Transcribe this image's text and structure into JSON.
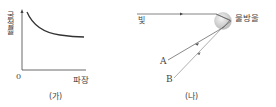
{
  "panel_a": {
    "caption": "(가)",
    "y_axis_label": "굴절률",
    "x_axis_label": "파장",
    "origin_label": "0",
    "curve": "refractive index decreases with wavelength (decaying curve)"
  },
  "panel_b": {
    "caption": "(나)",
    "light_label": "빛",
    "droplet_label": "물방울",
    "ray_a_label": "A",
    "ray_b_label": "B"
  },
  "colors": {
    "line": "#333333",
    "ray": "#555555",
    "droplet_light": "#f2f2f2",
    "droplet_dark": "#bdbdbd"
  }
}
